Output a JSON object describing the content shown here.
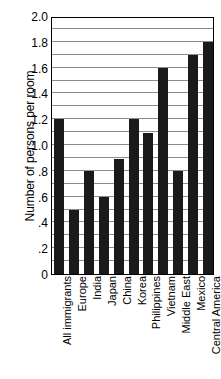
{
  "chart_data": {
    "type": "bar",
    "title": "",
    "xlabel": "",
    "ylabel": "Number of persons per room",
    "ylim": [
      0,
      2.0
    ],
    "grid": true,
    "grid_interval": 0.1,
    "legend": "none",
    "orientation": "vertical",
    "bar_color": "#1a1a1a",
    "categories": [
      "All immigrants",
      "Europe",
      "India",
      "Japan",
      "China",
      "Korea",
      "Philippines",
      "Vietnam",
      "Middle East",
      "Mexico",
      "Central America"
    ],
    "values": [
      1.2,
      0.5,
      0.8,
      0.6,
      0.89,
      1.2,
      1.09,
      1.6,
      0.8,
      1.7,
      1.8
    ],
    "y_ticks": [
      0,
      0.2,
      0.4,
      0.6,
      0.8,
      1.0,
      1.2,
      1.4,
      1.6,
      1.8,
      2.0
    ],
    "y_tick_labels": [
      "0",
      ".2",
      ".4",
      ".6",
      ".8",
      "1.0",
      "1.2",
      "1.4",
      "1.6",
      "1.8",
      "2.0"
    ]
  }
}
